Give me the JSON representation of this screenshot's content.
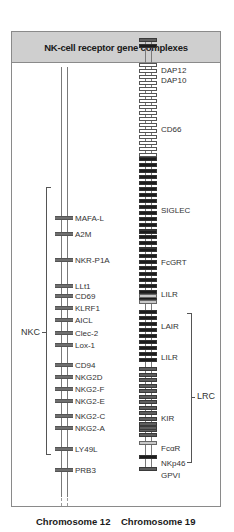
{
  "title": "NK-cell receptor gene complexes",
  "chromosome12": {
    "label": "Chromosome 12",
    "complex_label": "NKC",
    "genes": [
      {
        "name": "MAFA-L",
        "y": 218
      },
      {
        "name": "A2M",
        "y": 234
      },
      {
        "name": "NKR-P1A",
        "y": 260
      },
      {
        "name": "LLt1",
        "y": 286
      },
      {
        "name": "CD69",
        "y": 296
      },
      {
        "name": "KLRF1",
        "y": 308
      },
      {
        "name": "AICL",
        "y": 320
      },
      {
        "name": "Clec-2",
        "y": 333
      },
      {
        "name": "Lox-1",
        "y": 345
      },
      {
        "name": "CD94",
        "y": 365
      },
      {
        "name": "NKG2D",
        "y": 377
      },
      {
        "name": "NKG2-F",
        "y": 389
      },
      {
        "name": "NKG2-E",
        "y": 401
      },
      {
        "name": "NKG2-C",
        "y": 416
      },
      {
        "name": "NKG2-A",
        "y": 428
      },
      {
        "name": "LY49L",
        "y": 449
      },
      {
        "name": "PRB3",
        "y": 470
      }
    ]
  },
  "chromosome19": {
    "label": "Chromosome 19",
    "complex_label": "LRC",
    "genes": [
      {
        "name": "DAP12",
        "label_y": 70
      },
      {
        "name": "DAP10",
        "label_y": 80
      },
      {
        "name": "CD66",
        "label_y": 129
      },
      {
        "name": "SIGLEC",
        "label_y": 210
      },
      {
        "name": "FcGRT",
        "label_y": 262
      },
      {
        "name": "LILR",
        "label_y": 294
      },
      {
        "name": "LAIR",
        "label_y": 326
      },
      {
        "name": "LILR",
        "label_y": 357
      },
      {
        "name": "KIR",
        "label_y": 418
      },
      {
        "name": "FcαR",
        "label_y": 448
      },
      {
        "name": "NKp46",
        "label_y": 463
      },
      {
        "name": "GPVI",
        "label_y": 475
      }
    ]
  },
  "colors": {
    "header_bg": "#cfcfcf",
    "frame": "#8a8a8a",
    "gene_grey": "#6e6e6e",
    "gene_black": "#1c1c1c",
    "gene_light": "#c8c8c8"
  }
}
